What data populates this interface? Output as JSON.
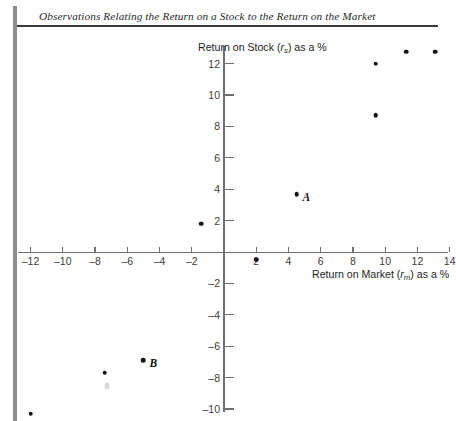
{
  "title": "Observations Relating the Return on a Stock to the Return on the Market",
  "chart_data": {
    "type": "scatter",
    "title": "Observations Relating the Return on a Stock to the Return on the Market",
    "xlabel": "Return on Market (rm) as a %",
    "ylabel": "Return on Stock (rs) as a %",
    "xlabel_parts": {
      "pre": "Return on Market (",
      "var": "r",
      "sub": "m",
      "post": ") as a %"
    },
    "ylabel_parts": {
      "pre": "Return on Stock (",
      "var": "r",
      "sub": "s",
      "post": ") as a %"
    },
    "xlim": [
      -13.5,
      14.8
    ],
    "ylim": [
      -11.2,
      13.5
    ],
    "xticks": [
      -12,
      -10,
      -8,
      -6,
      -4,
      -2,
      2,
      4,
      6,
      8,
      10,
      12,
      14
    ],
    "yticks": [
      -10,
      -8,
      -6,
      -4,
      -2,
      2,
      4,
      6,
      8,
      10,
      12
    ],
    "xtick_labels": [
      "–12",
      "–10",
      "–8",
      "–6",
      "–4",
      "–2",
      "2",
      "4",
      "6",
      "8",
      "10",
      "12",
      "14"
    ],
    "ytick_labels": [
      "–10",
      "–8",
      "–6",
      "–4",
      "–2",
      "2",
      "4",
      "6",
      "8",
      "10",
      "12"
    ],
    "grid": false,
    "legend": null,
    "points": [
      {
        "x": -12.0,
        "y": -10.3,
        "label": null
      },
      {
        "x": -7.4,
        "y": -7.7,
        "label": null
      },
      {
        "x": -5.0,
        "y": -6.9,
        "label": "B"
      },
      {
        "x": -1.4,
        "y": 1.8,
        "label": null
      },
      {
        "x": 2.0,
        "y": -0.5,
        "label": null
      },
      {
        "x": 4.5,
        "y": 3.7,
        "label": "A"
      },
      {
        "x": 9.4,
        "y": 8.7,
        "label": null
      },
      {
        "x": 9.4,
        "y": 12.0,
        "label": null
      },
      {
        "x": 11.3,
        "y": 12.75,
        "label": null
      },
      {
        "x": 13.1,
        "y": 12.75,
        "label": null
      }
    ],
    "annotations": [
      {
        "text": "A",
        "x": 4.5,
        "y": 3.7
      },
      {
        "text": "B",
        "x": -5.0,
        "y": -6.9
      }
    ]
  }
}
